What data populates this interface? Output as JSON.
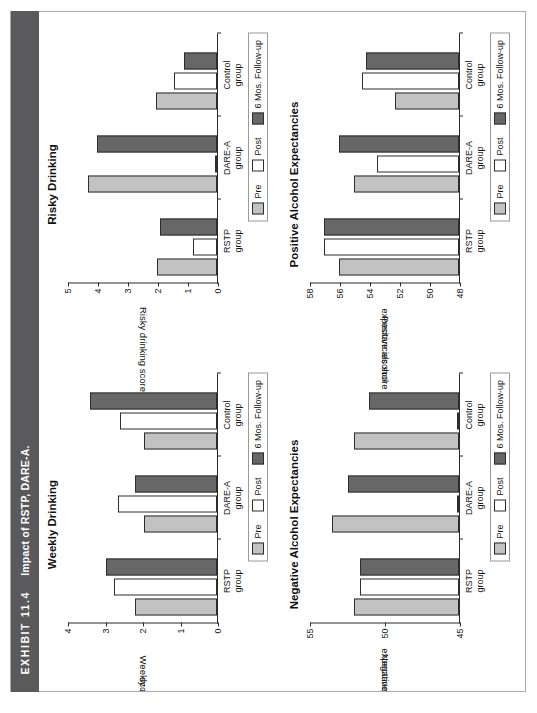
{
  "exhibit": {
    "number": "EXHIBIT 11.4",
    "caption": "Impact of RSTP, DARE-A."
  },
  "legend": {
    "pre": "Pre",
    "post": "Post",
    "followup": "6 Mos. Follow-up"
  },
  "axis": {
    "xlabel": "Treatment Group"
  },
  "groups": [
    {
      "line1": "RSTP",
      "line2": "group"
    },
    {
      "line1": "DARE-A",
      "line2": "group"
    },
    {
      "line1": "Control",
      "line2": "group"
    }
  ],
  "colors": {
    "pre": "#c2c2c2",
    "post": "#ffffff",
    "followup": "#676767",
    "exhibit_bar": "#5a5a5c",
    "axis": "#2a2a2a"
  },
  "chart_data": [
    {
      "id": "weekly-drinking",
      "type": "bar",
      "title": "Weekly Drinking",
      "xlabel": "Treatment Group",
      "ylabel": "Weekly drinking\nscore",
      "ylabel_line1": "Weekly drinking",
      "ylabel_line2": "score",
      "categories": [
        "RSTP group",
        "DARE-A group",
        "Control group"
      ],
      "ylim": [
        0,
        4
      ],
      "yticks": [
        0,
        1,
        2,
        3,
        4
      ],
      "grid": false,
      "legend_position": "right",
      "series": [
        {
          "name": "Pre",
          "values": [
            2.2,
            1.95,
            1.95
          ]
        },
        {
          "name": "Post",
          "values": [
            2.75,
            2.65,
            2.6
          ]
        },
        {
          "name": "6 Mos. Follow-up",
          "values": [
            2.95,
            2.2,
            3.4
          ]
        }
      ]
    },
    {
      "id": "risky-drinking",
      "type": "bar",
      "title": "Risky Drinking",
      "xlabel": "Treatment Group",
      "ylabel": "Risky drinking score",
      "ylabel_line1": "Risky drinking score",
      "ylabel_line2": "",
      "categories": [
        "RSTP group",
        "DARE-A group",
        "Control group"
      ],
      "ylim": [
        0,
        5
      ],
      "yticks": [
        0,
        1,
        2,
        3,
        4,
        5
      ],
      "grid": false,
      "legend_position": "right",
      "series": [
        {
          "name": "Pre",
          "values": [
            2.0,
            4.3,
            2.05
          ]
        },
        {
          "name": "Post",
          "values": [
            0.8,
            0.05,
            1.45
          ]
        },
        {
          "name": "6 Mos. Follow-up",
          "values": [
            1.9,
            4.0,
            1.1
          ]
        }
      ]
    },
    {
      "id": "negative-alcohol-expectancies",
      "type": "bar",
      "title": "Negative Alcohol Expectancies",
      "xlabel": "Treatment Group",
      "ylabel": "Negative alcohol\nexpectancies score",
      "ylabel_line1": "Negative alcohol",
      "ylabel_line2": "expectancies score",
      "categories": [
        "RSTP group",
        "DARE-A group",
        "Control group"
      ],
      "ylim": [
        45,
        55
      ],
      "yticks": [
        45,
        50,
        55
      ],
      "grid": false,
      "legend_position": "right",
      "series": [
        {
          "name": "Pre",
          "values": [
            52.0,
            53.5,
            52.0
          ]
        },
        {
          "name": "Post",
          "values": [
            51.6,
            45.0,
            45.0
          ]
        },
        {
          "name": "6 Mos. Follow-up",
          "values": [
            51.6,
            52.4,
            51.0
          ]
        }
      ]
    },
    {
      "id": "positive-alcohol-expectancies",
      "type": "bar",
      "title": "Positive Alcohol Expectancies",
      "xlabel": "Treatment Group",
      "ylabel": "Positive alcohol\nexpectancies score",
      "ylabel_line1": "Positive alcohol",
      "ylabel_line2": "expectancies score",
      "categories": [
        "RSTP group",
        "DARE-A group",
        "Control group"
      ],
      "ylim": [
        48,
        58
      ],
      "yticks": [
        48,
        50,
        52,
        54,
        56,
        58
      ],
      "grid": false,
      "legend_position": "right",
      "series": [
        {
          "name": "Pre",
          "values": [
            56.0,
            55.0,
            52.3
          ]
        },
        {
          "name": "Post",
          "values": [
            57.0,
            53.5,
            54.5
          ]
        },
        {
          "name": "6 Mos. Follow-up",
          "values": [
            57.0,
            56.0,
            54.2
          ]
        }
      ]
    }
  ]
}
